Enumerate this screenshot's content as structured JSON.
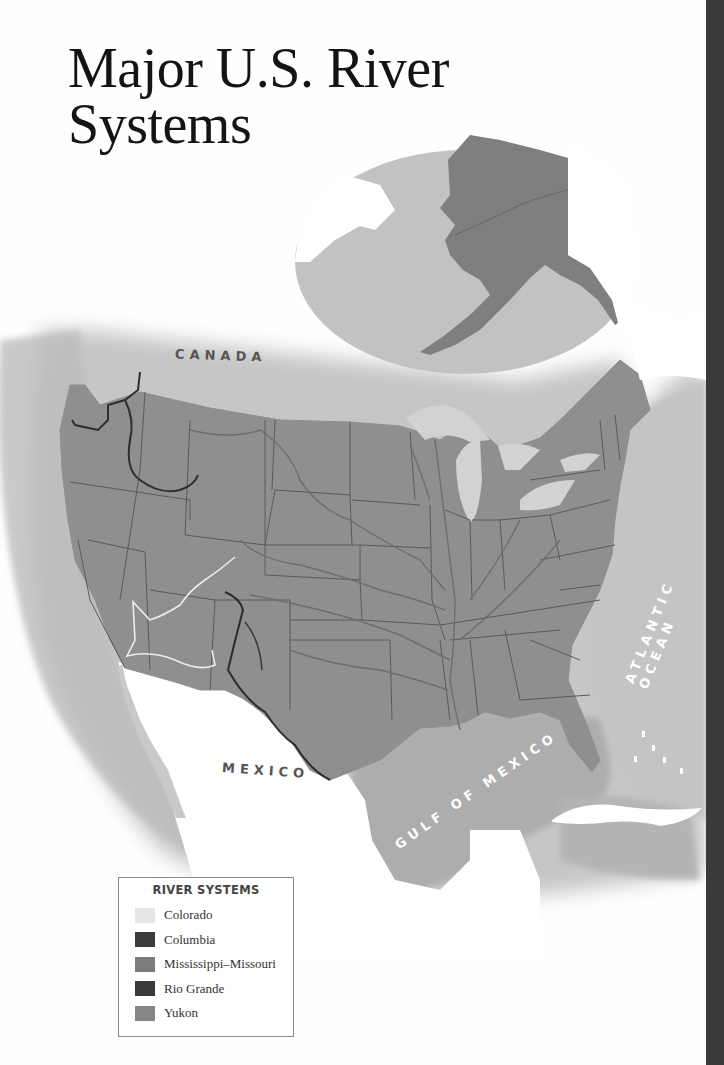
{
  "title": {
    "line1": "Major U.S. River",
    "line2": "Systems"
  },
  "map_labels": {
    "canada": "CANADA",
    "mexico": "MEXICO",
    "pacific_ocean": "PACIFIC OCEAN",
    "atlantic_ocean": "ATLANTIC OCEAN",
    "gulf_of_mexico": "GULF OF MEXICO"
  },
  "inset": {
    "region": "Alaska"
  },
  "legend": {
    "title": "RIVER SYSTEMS",
    "items": [
      {
        "label": "Colorado",
        "color": "#e6e6e6"
      },
      {
        "label": "Columbia",
        "color": "#3c3c3c"
      },
      {
        "label": "Mississippi–Missouri",
        "color": "#7c7c7c"
      },
      {
        "label": "Rio Grande",
        "color": "#3a3a3a"
      },
      {
        "label": "Yukon",
        "color": "#868686"
      }
    ]
  },
  "colors": {
    "land": "#8f8f8f",
    "water": "#c2c2c2",
    "foreign_land": "#ffffff",
    "state_border": "#5a5a5a"
  }
}
